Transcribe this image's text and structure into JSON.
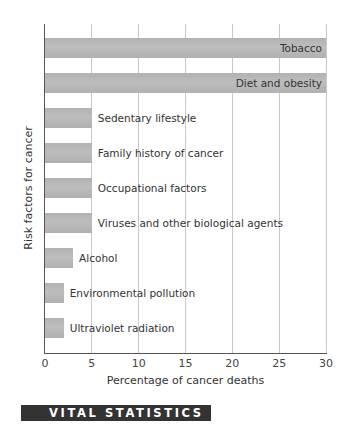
{
  "chart_data": {
    "type": "bar",
    "orientation": "horizontal",
    "title": "",
    "xlabel": "Percentage of cancer deaths",
    "ylabel": "Risk factors for cancer",
    "xlim": [
      0,
      30
    ],
    "xticks": [
      "0",
      "5",
      "10",
      "15",
      "20",
      "25",
      "30"
    ],
    "grid": true,
    "legend": null,
    "categories": [
      "Tobacco",
      "Diet and obesity",
      "Sedentary lifestyle",
      "Family history of cancer",
      "Occupational factors",
      "Viruses and other biological agents",
      "Alcohol",
      "Environmental pollution",
      "Ultraviolet radiation"
    ],
    "values": [
      30,
      30,
      5,
      5,
      5,
      5,
      3,
      2,
      2
    ]
  },
  "banner": {
    "label": "VITAL STATISTICS"
  }
}
